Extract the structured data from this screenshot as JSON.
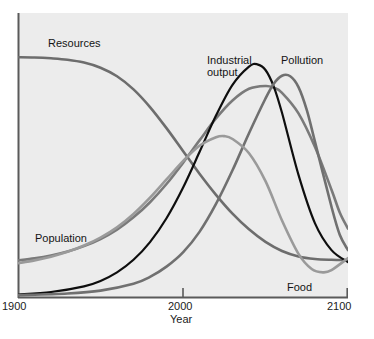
{
  "chart_data": {
    "type": "line",
    "title": "",
    "subtitle": "",
    "xlabel": "Year",
    "ylabel": "",
    "xlim": [
      1900,
      2100
    ],
    "ylim": [
      0,
      1
    ],
    "grid": false,
    "legend_position": "inline-annotations",
    "x_ticks": [
      {
        "value": 1900,
        "label": "1900"
      },
      {
        "value": 2000,
        "label": "2000"
      },
      {
        "value": 2100,
        "label": "2100"
      }
    ],
    "y_ticks": [],
    "annotations": [
      {
        "text": "Resources",
        "x": 1930,
        "y": 0.93
      },
      {
        "text": "Industrial",
        "x": 2015,
        "y": 0.85
      },
      {
        "text": "output",
        "x": 2015,
        "y": 0.8
      },
      {
        "text": "Pollution",
        "x": 2060,
        "y": 0.85
      },
      {
        "text": "Population",
        "x": 1910,
        "y": 0.22
      },
      {
        "text": "Food",
        "x": 2064,
        "y": 0.055
      }
    ],
    "series": [
      {
        "name": "Resources",
        "color": "#6d6d6d",
        "width": 2.6,
        "points": [
          [
            1900,
            0.845
          ],
          [
            1910,
            0.844
          ],
          [
            1920,
            0.841
          ],
          [
            1930,
            0.836
          ],
          [
            1940,
            0.826
          ],
          [
            1950,
            0.808
          ],
          [
            1960,
            0.778
          ],
          [
            1970,
            0.732
          ],
          [
            1980,
            0.67
          ],
          [
            1990,
            0.596
          ],
          [
            2000,
            0.516
          ],
          [
            2010,
            0.436
          ],
          [
            2020,
            0.362
          ],
          [
            2030,
            0.296
          ],
          [
            2040,
            0.241
          ],
          [
            2050,
            0.197
          ],
          [
            2060,
            0.165
          ],
          [
            2070,
            0.146
          ],
          [
            2080,
            0.137
          ],
          [
            2090,
            0.134
          ],
          [
            2100,
            0.133
          ]
        ]
      },
      {
        "name": "Population",
        "color": "#7a7a7a",
        "width": 2.6,
        "points": [
          [
            1900,
            0.132
          ],
          [
            1910,
            0.139
          ],
          [
            1920,
            0.149
          ],
          [
            1930,
            0.163
          ],
          [
            1940,
            0.182
          ],
          [
            1950,
            0.207
          ],
          [
            1960,
            0.24
          ],
          [
            1970,
            0.283
          ],
          [
            1980,
            0.336
          ],
          [
            1990,
            0.4
          ],
          [
            2000,
            0.474
          ],
          [
            2010,
            0.553
          ],
          [
            2020,
            0.63
          ],
          [
            2030,
            0.693
          ],
          [
            2040,
            0.734
          ],
          [
            2050,
            0.744
          ],
          [
            2055,
            0.738
          ],
          [
            2060,
            0.72
          ],
          [
            2070,
            0.648
          ],
          [
            2080,
            0.53
          ],
          [
            2090,
            0.38
          ],
          [
            2095,
            0.3
          ],
          [
            2100,
            0.243
          ]
        ]
      },
      {
        "name": "Industrial output",
        "color": "#0e0e0e",
        "width": 2.2,
        "points": [
          [
            1900,
            0.012
          ],
          [
            1920,
            0.021
          ],
          [
            1940,
            0.041
          ],
          [
            1950,
            0.06
          ],
          [
            1960,
            0.09
          ],
          [
            1970,
            0.134
          ],
          [
            1980,
            0.196
          ],
          [
            1990,
            0.28
          ],
          [
            2000,
            0.387
          ],
          [
            2010,
            0.512
          ],
          [
            2020,
            0.64
          ],
          [
            2030,
            0.748
          ],
          [
            2040,
            0.812
          ],
          [
            2045,
            0.82
          ],
          [
            2050,
            0.8
          ],
          [
            2055,
            0.742
          ],
          [
            2060,
            0.65
          ],
          [
            2070,
            0.432
          ],
          [
            2080,
            0.262
          ],
          [
            2090,
            0.168
          ],
          [
            2100,
            0.126
          ]
        ]
      },
      {
        "name": "Pollution",
        "color": "#707070",
        "width": 2.6,
        "points": [
          [
            1900,
            0.01
          ],
          [
            1930,
            0.016
          ],
          [
            1950,
            0.026
          ],
          [
            1970,
            0.05
          ],
          [
            1980,
            0.074
          ],
          [
            1990,
            0.11
          ],
          [
            2000,
            0.16
          ],
          [
            2010,
            0.232
          ],
          [
            2020,
            0.33
          ],
          [
            2030,
            0.448
          ],
          [
            2040,
            0.578
          ],
          [
            2050,
            0.7
          ],
          [
            2055,
            0.752
          ],
          [
            2060,
            0.78
          ],
          [
            2065,
            0.778
          ],
          [
            2070,
            0.74
          ],
          [
            2075,
            0.66
          ],
          [
            2080,
            0.548
          ],
          [
            2090,
            0.32
          ],
          [
            2095,
            0.222
          ],
          [
            2100,
            0.168
          ]
        ]
      },
      {
        "name": "Food",
        "color": "#9a9a9a",
        "width": 2.6,
        "points": [
          [
            1900,
            0.122
          ],
          [
            1910,
            0.132
          ],
          [
            1920,
            0.145
          ],
          [
            1930,
            0.162
          ],
          [
            1940,
            0.184
          ],
          [
            1950,
            0.212
          ],
          [
            1960,
            0.248
          ],
          [
            1970,
            0.295
          ],
          [
            1980,
            0.352
          ],
          [
            1990,
            0.416
          ],
          [
            2000,
            0.48
          ],
          [
            2010,
            0.534
          ],
          [
            2020,
            0.564
          ],
          [
            2025,
            0.568
          ],
          [
            2030,
            0.558
          ],
          [
            2040,
            0.508
          ],
          [
            2050,
            0.41
          ],
          [
            2060,
            0.272
          ],
          [
            2070,
            0.155
          ],
          [
            2078,
            0.102
          ],
          [
            2085,
            0.09
          ],
          [
            2090,
            0.098
          ],
          [
            2100,
            0.14
          ]
        ]
      }
    ]
  },
  "axis": {
    "left_x_px": 18,
    "right_x_px": 348,
    "top_y_px": 13,
    "bottom_y_px": 298,
    "color": "#5a5a5a",
    "x_title": "Year",
    "tick_1900": "1900",
    "tick_2000": "2000",
    "tick_2100": "2100"
  },
  "labels": {
    "resources": "Resources",
    "industrial_line1": "Industrial",
    "industrial_line2": "output",
    "pollution": "Pollution",
    "population": "Population",
    "food": "Food"
  },
  "plot_background": "#ececec"
}
